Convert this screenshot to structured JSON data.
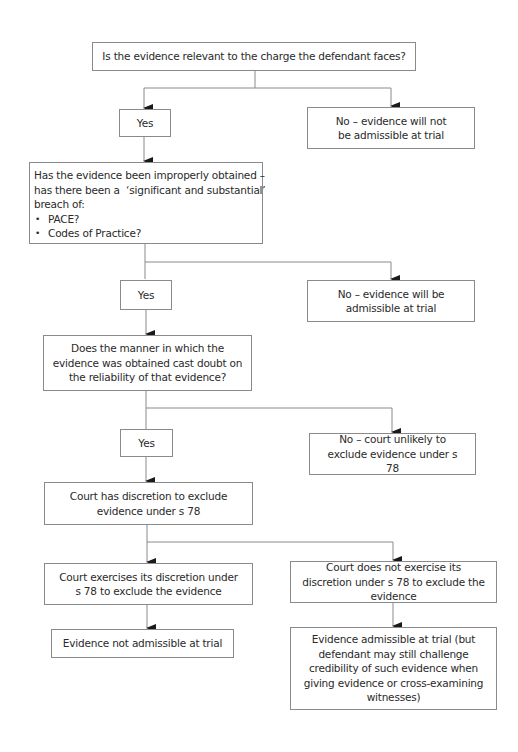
{
  "diagram": {
    "type": "flowchart",
    "nodes": {
      "q_relevant": {
        "text": "Is the evidence relevant to the charge the defendant faces?"
      },
      "yes_1": {
        "text": "Yes"
      },
      "no_1": {
        "text": "No – evidence will not be admissible at trial"
      },
      "q_improper": {
        "lines": [
          "Has the evidence been improperly obtained –",
          "has there been a  ‘significant and substantial’",
          "breach of:"
        ],
        "bullets": [
          "PACE?",
          "Codes of Practice?"
        ]
      },
      "yes_2": {
        "text": "Yes"
      },
      "no_2": {
        "text": "No – evidence will be admissible at trial"
      },
      "q_reliability": {
        "text": "Does the manner in which the evidence was obtained cast doubt on the reliability of that evidence?"
      },
      "yes_3": {
        "text": "Yes"
      },
      "no_3": {
        "text": "No – court unlikely to exclude evidence under s 78"
      },
      "discretion": {
        "text": "Court has discretion to exclude evidence under s 78"
      },
      "exercise": {
        "text": "Court exercises its discretion under s 78 to exclude the evidence"
      },
      "not_exercise": {
        "text": "Court does not exercise its discretion under s 78 to exclude the evidence"
      },
      "not_admissible": {
        "text": "Evidence not admissible at trial"
      },
      "admissible": {
        "text": "Evidence admissible at trial (but defendant may still challenge credibility of such evidence when giving evidence or cross-examining witnesses)"
      }
    },
    "edges": [
      [
        "q_relevant",
        "yes_1"
      ],
      [
        "q_relevant",
        "no_1"
      ],
      [
        "yes_1",
        "q_improper"
      ],
      [
        "q_improper",
        "yes_2"
      ],
      [
        "q_improper",
        "no_2"
      ],
      [
        "yes_2",
        "q_reliability"
      ],
      [
        "q_reliability",
        "yes_3"
      ],
      [
        "q_reliability",
        "no_3"
      ],
      [
        "yes_3",
        "discretion"
      ],
      [
        "discretion",
        "exercise"
      ],
      [
        "discretion",
        "not_exercise"
      ],
      [
        "exercise",
        "not_admissible"
      ],
      [
        "not_exercise",
        "admissible"
      ]
    ],
    "colors": {
      "line": "#8a8a8a",
      "arrow": "#1a1a1a",
      "text": "#2a2a2a",
      "background": "#ffffff"
    }
  }
}
